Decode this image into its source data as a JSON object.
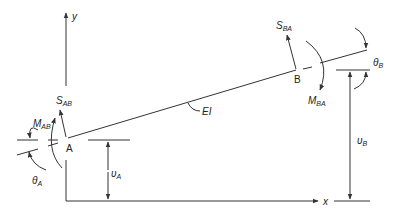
{
  "diagram": {
    "type": "beam element free-body diagram",
    "axes": {
      "x_label": "x",
      "y_label": "y"
    },
    "nodes": [
      {
        "label": "A",
        "shear": {
          "sym": "S",
          "sub": "AB"
        },
        "moment": {
          "sym": "M",
          "sub": "AB"
        },
        "rotation": {
          "sym": "θ",
          "sub": "A"
        },
        "displacement": {
          "sym": "υ",
          "sub": "A"
        }
      },
      {
        "label": "B",
        "shear": {
          "sym": "S",
          "sub": "BA"
        },
        "moment": {
          "sym": "M",
          "sub": "BA"
        },
        "rotation": {
          "sym": "θ",
          "sub": "B"
        },
        "displacement": {
          "sym": "υ",
          "sub": "B"
        }
      }
    ],
    "member_label": "EI",
    "colors": {
      "line": "#333333",
      "text": "#222222",
      "background": "#ffffff"
    }
  }
}
